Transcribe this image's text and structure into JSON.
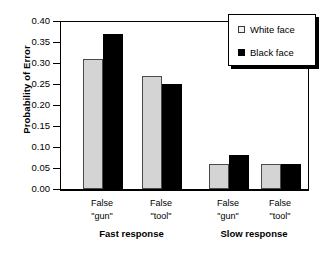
{
  "chart_data": {
    "type": "bar",
    "title": "",
    "subtitle": "",
    "xlabel": "",
    "ylabel": "Probability of  Error",
    "ylim": [
      0.0,
      0.4
    ],
    "ytick_labels": [
      "0.00",
      "0.05",
      "0.10",
      "0.15",
      "0.20",
      "0.25",
      "0.30",
      "0.35",
      "0.40"
    ],
    "ytick_values": [
      0.0,
      0.05,
      0.1,
      0.15,
      0.2,
      0.25,
      0.3,
      0.35,
      0.4
    ],
    "grid": false,
    "legend_position": "top-right",
    "categories": [
      "False \"gun\"",
      "False \"tool\"",
      "False \"gun\"",
      "False \"tool\""
    ],
    "category_lines": [
      [
        "False",
        "\"gun\""
      ],
      [
        "False",
        "\"tool\""
      ],
      [
        "False",
        "\"gun\""
      ],
      [
        "False",
        "\"tool\""
      ]
    ],
    "groups": [
      {
        "label": "Fast response",
        "categories": [
          "False \"gun\"",
          "False \"tool\""
        ]
      },
      {
        "label": "Slow response",
        "categories": [
          "False \"gun\"",
          "False \"tool\""
        ]
      }
    ],
    "series": [
      {
        "name": "White face",
        "color": "#d4d4d4",
        "values": [
          0.31,
          0.27,
          0.06,
          0.06
        ]
      },
      {
        "name": "Black face",
        "color": "#000000",
        "values": [
          0.37,
          0.25,
          0.08,
          0.06
        ]
      }
    ],
    "legend": [
      {
        "label": "White face",
        "swatch": "white"
      },
      {
        "label": "Black face",
        "swatch": "black"
      }
    ]
  }
}
